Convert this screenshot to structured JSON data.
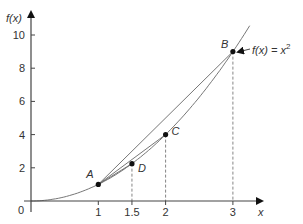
{
  "chart_data": {
    "type": "line",
    "title": "",
    "function_label": "f(x) = x²",
    "function_label_base": "f(x) = x",
    "function_label_exp": "2",
    "xlabel": "x",
    "ylabel": "f(x)",
    "origin_label": "0",
    "xlim": [
      0,
      3.3
    ],
    "ylim": [
      0,
      11
    ],
    "x_ticks": [
      1,
      1.5,
      2,
      3
    ],
    "x_tick_labels": [
      "1",
      "1.5",
      "2",
      "3"
    ],
    "y_ticks": [
      2,
      4,
      6,
      8,
      10
    ],
    "y_tick_labels": [
      "2",
      "4",
      "6",
      "8",
      "10"
    ],
    "grid": false,
    "series": [
      {
        "name": "f(x) = x^2",
        "x": [
          0,
          0.5,
          1,
          1.5,
          2,
          2.5,
          3,
          3.25
        ],
        "y": [
          0,
          0.25,
          1,
          2.25,
          4,
          6.25,
          9,
          10.56
        ]
      }
    ],
    "points": [
      {
        "label": "A",
        "x": 1,
        "y": 1
      },
      {
        "label": "D",
        "x": 1.5,
        "y": 2.25
      },
      {
        "label": "C",
        "x": 2,
        "y": 4
      },
      {
        "label": "B",
        "x": 3,
        "y": 9
      }
    ],
    "chords": [
      {
        "from": "A",
        "to": "B"
      },
      {
        "from": "A",
        "to": "C"
      },
      {
        "from": "A",
        "to": "D"
      }
    ],
    "dashed_drops": [
      1.5,
      2,
      3
    ]
  }
}
